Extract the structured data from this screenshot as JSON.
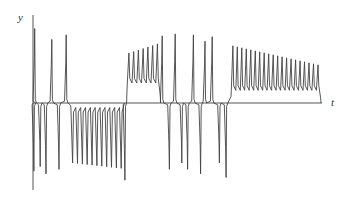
{
  "chart_data": {
    "type": "line",
    "title": "",
    "xlabel": "t",
    "ylabel": "y",
    "grid": false,
    "legend": null,
    "axes": {
      "origin_px": [
        33,
        103
      ],
      "x_axis_end_px": 322,
      "y_axis_top_px": 15,
      "y_axis_bottom_px": 190,
      "ticks": "none"
    },
    "segments": [
      {
        "kind": "spike",
        "sign": -1,
        "t": 0.003,
        "amp": 0.75
      },
      {
        "kind": "spike",
        "sign": 1,
        "t": 0.006,
        "amp": 0.82
      },
      {
        "kind": "spike",
        "sign": -1,
        "t": 0.025,
        "amp": 0.7
      },
      {
        "kind": "spike",
        "sign": -1,
        "t": 0.045,
        "amp": 0.78
      },
      {
        "kind": "spike",
        "sign": 1,
        "t": 0.065,
        "amp": 0.7
      },
      {
        "kind": "spike",
        "sign": -1,
        "t": 0.09,
        "amp": 0.73
      },
      {
        "kind": "spike",
        "sign": 1,
        "t": 0.115,
        "amp": 0.75
      },
      {
        "kind": "osc",
        "sign": -1,
        "t0": 0.13,
        "t1": 0.315,
        "cycles": 11,
        "amp0": 0.66,
        "amp1": 0.72,
        "base": 0.05
      },
      {
        "kind": "spike",
        "sign": -1,
        "t": 0.318,
        "amp": 0.85
      },
      {
        "kind": "osc",
        "sign": 1,
        "t0": 0.325,
        "t1": 0.44,
        "cycles": 7,
        "amp0": 0.55,
        "amp1": 0.65,
        "base": 0.22
      },
      {
        "kind": "spike",
        "sign": 1,
        "t": 0.447,
        "amp": 0.74
      },
      {
        "kind": "spike",
        "sign": -1,
        "t": 0.472,
        "amp": 0.73
      },
      {
        "kind": "spike",
        "sign": 1,
        "t": 0.492,
        "amp": 0.76
      },
      {
        "kind": "spike",
        "sign": -1,
        "t": 0.515,
        "amp": 0.66
      },
      {
        "kind": "spike",
        "sign": -1,
        "t": 0.535,
        "amp": 0.73
      },
      {
        "kind": "spike",
        "sign": 1,
        "t": 0.555,
        "amp": 0.75
      },
      {
        "kind": "spike",
        "sign": -1,
        "t": 0.58,
        "amp": 0.78
      },
      {
        "kind": "spike",
        "sign": 1,
        "t": 0.595,
        "amp": 0.68
      },
      {
        "kind": "spike",
        "sign": 1,
        "t": 0.62,
        "amp": 0.73
      },
      {
        "kind": "spike",
        "sign": -1,
        "t": 0.645,
        "amp": 0.66
      },
      {
        "kind": "spike",
        "sign": -1,
        "t": 0.668,
        "amp": 0.82
      },
      {
        "kind": "osc",
        "sign": 1,
        "t0": 0.685,
        "t1": 0.995,
        "cycles": 20,
        "amp0": 0.63,
        "amp1": 0.42,
        "base": 0.14
      }
    ]
  }
}
